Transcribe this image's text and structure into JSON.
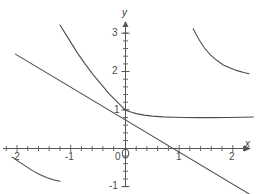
{
  "chart_data": {
    "type": "line",
    "title": "",
    "xlabel": "x",
    "ylabel": "y",
    "xlim": [
      -2.28,
      2.42
    ],
    "ylim": [
      -1.22,
      3.32
    ],
    "grid": false,
    "legend": null,
    "axis_style": "cartesian-crosshair",
    "x_ticks_major": [
      -2,
      -1,
      0,
      1,
      2
    ],
    "x_tick_labels": [
      "-2",
      "-1",
      "0",
      "1",
      "2"
    ],
    "y_ticks_major": [
      -1,
      0,
      1,
      2,
      3
    ],
    "y_tick_labels": [
      "-1",
      "0",
      "1",
      "2",
      "3"
    ],
    "minor_tick_step": 0.2,
    "axis_color": "#555555",
    "curve_color": "#4c4c4c",
    "series": [
      {
        "name": "decaying-curve",
        "description": "smooth decreasing curve through (0,1) flattening to horizontal asymptote near y=0.8",
        "x": [
          -1.22,
          -1.05,
          -0.9,
          -0.75,
          -0.6,
          -0.45,
          -0.3,
          -0.2,
          -0.1,
          0.0,
          0.1,
          0.2,
          0.35,
          0.5,
          0.7,
          0.9,
          1.1,
          1.35,
          1.6,
          1.9,
          2.15,
          2.38
        ],
        "y": [
          3.22,
          2.84,
          2.5,
          2.2,
          1.92,
          1.67,
          1.42,
          1.28,
          1.14,
          1.0,
          0.95,
          0.91,
          0.87,
          0.845,
          0.825,
          0.815,
          0.81,
          0.805,
          0.805,
          0.808,
          0.815,
          0.822
        ]
      },
      {
        "name": "tangent-line",
        "description": "straight tangent line touching the curve at (0,1), crossing x-axis near x=1.4",
        "x": [
          -2.05,
          2.32
        ],
        "y": [
          2.46,
          -1.2
        ]
      },
      {
        "name": "hyperbola-branch-upper-right",
        "description": "decreasing convex branch in the upper right region",
        "x": [
          1.26,
          1.36,
          1.46,
          1.58,
          1.7,
          1.82,
          1.95,
          2.08,
          2.2,
          2.3
        ],
        "y": [
          3.12,
          2.86,
          2.64,
          2.44,
          2.3,
          2.18,
          2.1,
          2.03,
          1.98,
          1.95
        ]
      },
      {
        "name": "hyperbola-branch-lower-left",
        "description": "decreasing concave branch in the lower left region",
        "x": [
          -2.08,
          -1.98,
          -1.86,
          -1.74,
          -1.6,
          -1.46,
          -1.33,
          -1.22
        ],
        "y": [
          -0.25,
          -0.35,
          -0.46,
          -0.57,
          -0.68,
          -0.76,
          -0.82,
          -0.855
        ]
      }
    ]
  },
  "labels": {
    "x_axis_name": "x",
    "y_axis_name": "y",
    "x_neg2": "-2",
    "x_neg1": "-1",
    "origin": "0",
    "x_pos1": "1",
    "x_pos2": "2",
    "y_pos1": "1",
    "y_pos2": "2",
    "y_pos3": "3",
    "y_neg1": "-1"
  }
}
